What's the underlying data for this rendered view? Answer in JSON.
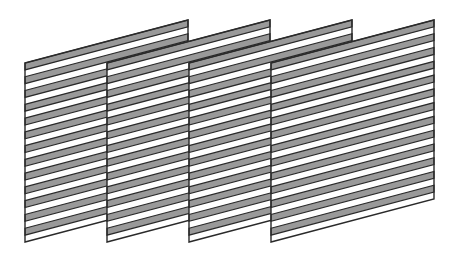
{
  "diagram": {
    "panel_count": 4,
    "panels": [
      {
        "id": 1,
        "left_x": 25
      },
      {
        "id": 2,
        "left_x": 107
      },
      {
        "id": 3,
        "left_x": 189
      },
      {
        "id": 4,
        "left_x": 271
      }
    ],
    "panel_width": 163,
    "left_top_y": 63,
    "left_bottom_y": 242,
    "right_top_y": 20,
    "right_bottom_y": 199,
    "stripe_count": 13,
    "colors": {
      "stripe_fill": "#999999",
      "background_fill": "#ffffff",
      "outline": "#2a2a2a"
    }
  }
}
